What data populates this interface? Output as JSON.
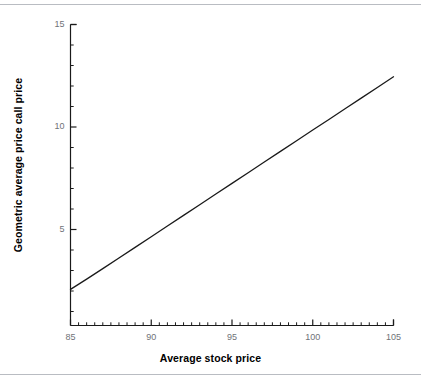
{
  "figure": {
    "background_color": "#ffffff",
    "rule_color": "#b9bcc2",
    "axis_color": "#1a1a1a",
    "curve_color": "#1a1a1a",
    "tick_label_color": "#6f7378",
    "axis_title_color": "#000000"
  },
  "chart_data": {
    "type": "line",
    "title": "",
    "subtitle": "",
    "xlabel": "Average stock price",
    "ylabel": "Geometric average price call price",
    "xlim": [
      85,
      105
    ],
    "ylim": [
      0,
      15
    ],
    "grid": false,
    "legend": null,
    "x_major_ticks": [
      85,
      90,
      95,
      100,
      105
    ],
    "x_major_tick_labels": [
      "85",
      "90",
      "95",
      "100",
      "105"
    ],
    "x_minor_tick_step": 0.5,
    "y_major_ticks": [
      5,
      10,
      15
    ],
    "y_major_tick_labels": [
      "5",
      "10",
      "15"
    ],
    "y_minor_tick_step": 1,
    "series": [
      {
        "name": "Geometric average price call price",
        "x": [
          85,
          86,
          87,
          88,
          89,
          90,
          91,
          92,
          93,
          94,
          95,
          96,
          97,
          98,
          99,
          100,
          101,
          102,
          103,
          104,
          105
        ],
        "values": [
          2.08,
          2.58,
          3.09,
          3.61,
          4.13,
          4.65,
          5.17,
          5.69,
          6.21,
          6.73,
          7.25,
          7.77,
          8.29,
          8.81,
          9.33,
          9.85,
          10.37,
          10.89,
          11.41,
          11.93,
          12.45
        ]
      }
    ],
    "annotations": []
  }
}
